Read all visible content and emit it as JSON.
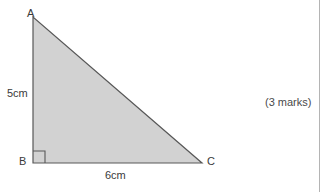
{
  "figure": {
    "type": "right-triangle-diagram",
    "vertices": [
      {
        "name": "A",
        "label": "A",
        "x": 33,
        "y": 17
      },
      {
        "name": "B",
        "label": "B",
        "x": 33,
        "y": 163
      },
      {
        "name": "C",
        "label": "C",
        "x": 202,
        "y": 163
      }
    ],
    "side_labels": {
      "ab": "5cm",
      "bc": "6cm"
    },
    "right_angle_at": "B",
    "right_angle_marker_size": 12,
    "colors": {
      "fill": "#d2d2d2",
      "stroke": "#585858",
      "label_text": "#3a3a3a",
      "background": "#ffffff",
      "divider": "#b4b4b4"
    }
  },
  "annotations": {
    "marks": "(3 marks)"
  }
}
